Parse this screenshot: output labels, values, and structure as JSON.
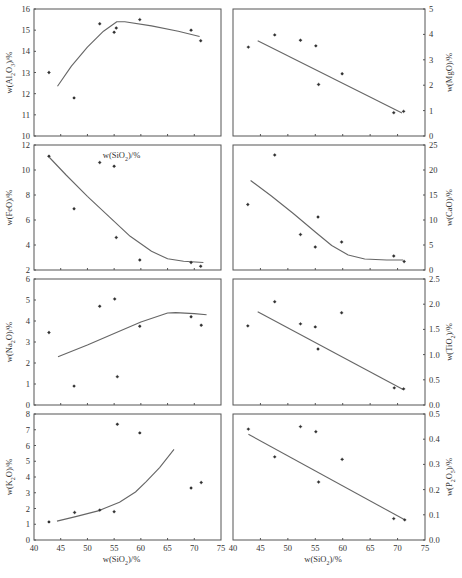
{
  "figure": {
    "x_axis_label": "w(SiO₂)/%",
    "x_ticks": [
      40,
      45,
      50,
      55,
      60,
      65,
      70,
      75
    ]
  },
  "chart_data": [
    {
      "id": "al2o3",
      "type": "scatter",
      "title": "",
      "xlabel": "w(SiO₂)/%",
      "ylabel": "w(Al₂O₃)/%",
      "xlim": [
        40,
        75
      ],
      "ylim": [
        10,
        16
      ],
      "y_ticks": [
        10,
        11,
        12,
        13,
        14,
        15,
        16
      ],
      "y_tick_format": 0,
      "axis_side": "left",
      "grid": false,
      "points": [
        [
          42.8,
          13.0
        ],
        [
          47.5,
          11.8
        ],
        [
          52.3,
          15.3
        ],
        [
          55.0,
          14.9
        ],
        [
          55.4,
          15.1
        ],
        [
          59.8,
          15.5
        ],
        [
          69.4,
          15.0
        ],
        [
          71.2,
          14.5
        ]
      ],
      "trend": [
        [
          44.4,
          12.35
        ],
        [
          47,
          13.3
        ],
        [
          50,
          14.2
        ],
        [
          53,
          14.95
        ],
        [
          55.5,
          15.4
        ],
        [
          57,
          15.4
        ],
        [
          62,
          15.2
        ],
        [
          67,
          14.95
        ],
        [
          71,
          14.7
        ]
      ]
    },
    {
      "id": "mgo",
      "type": "scatter",
      "title": "",
      "xlabel": "",
      "ylabel": "w(MgO)/%",
      "xlim": [
        40,
        75
      ],
      "ylim": [
        0,
        5
      ],
      "y_ticks": [
        0,
        1,
        2,
        3,
        4,
        5
      ],
      "y_tick_format": 0,
      "axis_side": "right",
      "grid": false,
      "points": [
        [
          42.8,
          3.5
        ],
        [
          47.6,
          3.98
        ],
        [
          52.3,
          3.77
        ],
        [
          55.1,
          3.55
        ],
        [
          55.6,
          2.03
        ],
        [
          59.9,
          2.45
        ],
        [
          69.3,
          0.92
        ],
        [
          71.1,
          0.97
        ]
      ],
      "trend": [
        [
          44.5,
          3.75
        ],
        [
          70.8,
          0.9
        ]
      ]
    },
    {
      "id": "feo",
      "type": "scatter",
      "title": "",
      "xlabel": "",
      "ylabel": "w(FeO)/%",
      "xlim": [
        40,
        75
      ],
      "ylim": [
        2,
        12
      ],
      "y_ticks": [
        2,
        4,
        6,
        8,
        10,
        12
      ],
      "y_tick_format": 0,
      "axis_side": "left",
      "grid": false,
      "points": [
        [
          42.8,
          11.1
        ],
        [
          47.5,
          6.9
        ],
        [
          52.3,
          10.6
        ],
        [
          55.0,
          10.3
        ],
        [
          55.4,
          4.6
        ],
        [
          59.8,
          2.8
        ],
        [
          69.4,
          2.6
        ],
        [
          71.2,
          2.3
        ]
      ],
      "trend": [
        [
          42.9,
          11.0
        ],
        [
          46,
          9.6
        ],
        [
          50,
          7.9
        ],
        [
          54,
          6.3
        ],
        [
          58,
          4.7
        ],
        [
          62,
          3.5
        ],
        [
          65,
          2.9
        ],
        [
          68,
          2.7
        ],
        [
          71.7,
          2.6
        ]
      ]
    },
    {
      "id": "cao",
      "type": "scatter",
      "title": "",
      "xlabel": "",
      "ylabel": "w(CaO)/%",
      "xlim": [
        40,
        75
      ],
      "ylim": [
        0,
        25
      ],
      "y_ticks": [
        0,
        5,
        10,
        15,
        20,
        25
      ],
      "y_tick_format": 0,
      "axis_side": "right",
      "grid": false,
      "points": [
        [
          42.7,
          13.1
        ],
        [
          47.6,
          23.0
        ],
        [
          52.3,
          7.1
        ],
        [
          55.0,
          4.6
        ],
        [
          55.5,
          10.6
        ],
        [
          59.8,
          5.6
        ],
        [
          69.3,
          2.8
        ],
        [
          71.2,
          1.7
        ]
      ],
      "trend": [
        [
          43.2,
          17.9
        ],
        [
          47,
          14.8
        ],
        [
          51,
          11.3
        ],
        [
          55,
          7.6
        ],
        [
          58,
          4.9
        ],
        [
          61,
          3.0
        ],
        [
          64,
          2.2
        ],
        [
          68,
          2.0
        ],
        [
          71,
          2.0
        ]
      ]
    },
    {
      "id": "na2o",
      "type": "scatter",
      "title": "",
      "xlabel": "",
      "ylabel": "w(Na₂O)/%",
      "xlim": [
        40,
        75
      ],
      "ylim": [
        0,
        6
      ],
      "y_ticks": [
        0,
        1,
        2,
        3,
        4,
        5,
        6
      ],
      "y_tick_format": 0,
      "axis_side": "left",
      "grid": false,
      "points": [
        [
          42.8,
          3.45
        ],
        [
          47.5,
          0.9
        ],
        [
          52.3,
          4.7
        ],
        [
          55.1,
          5.05
        ],
        [
          55.6,
          1.35
        ],
        [
          59.8,
          3.75
        ],
        [
          69.4,
          4.2
        ],
        [
          71.3,
          3.8
        ]
      ],
      "trend": [
        [
          44.5,
          2.3
        ],
        [
          50,
          2.85
        ],
        [
          55,
          3.4
        ],
        [
          60,
          3.95
        ],
        [
          65,
          4.38
        ],
        [
          66.5,
          4.4
        ],
        [
          70,
          4.35
        ],
        [
          72.3,
          4.3
        ]
      ]
    },
    {
      "id": "tio2",
      "type": "scatter",
      "title": "",
      "xlabel": "",
      "ylabel": "w(TiO₂)/%",
      "xlim": [
        40,
        75
      ],
      "ylim": [
        0,
        2.5
      ],
      "y_ticks": [
        0,
        0.5,
        1,
        1.5,
        2,
        2.5
      ],
      "y_tick_format": 1,
      "axis_side": "right",
      "grid": false,
      "points": [
        [
          42.7,
          1.57
        ],
        [
          47.6,
          2.05
        ],
        [
          52.3,
          1.61
        ],
        [
          55.0,
          1.55
        ],
        [
          55.5,
          1.11
        ],
        [
          59.8,
          1.83
        ],
        [
          69.4,
          0.34
        ],
        [
          71.1,
          0.32
        ]
      ],
      "trend": [
        [
          44.5,
          1.85
        ],
        [
          71.0,
          0.31
        ]
      ]
    },
    {
      "id": "k2o",
      "type": "scatter",
      "title": "",
      "xlabel": "w(SiO₂)/%",
      "ylabel": "w(K₂O)/%",
      "xlim": [
        40,
        75
      ],
      "ylim": [
        0,
        8
      ],
      "y_ticks": [
        0,
        1,
        2,
        3,
        4,
        5,
        6,
        7,
        8
      ],
      "y_tick_format": 0,
      "axis_side": "left",
      "grid": false,
      "points": [
        [
          42.8,
          1.15
        ],
        [
          47.6,
          1.75
        ],
        [
          52.3,
          1.9
        ],
        [
          55.0,
          1.8
        ],
        [
          55.6,
          7.35
        ],
        [
          59.8,
          6.8
        ],
        [
          69.4,
          3.3
        ],
        [
          71.3,
          3.65
        ]
      ],
      "trend": [
        [
          44.3,
          1.2
        ],
        [
          48,
          1.5
        ],
        [
          52,
          1.85
        ],
        [
          56,
          2.4
        ],
        [
          59,
          3.05
        ],
        [
          61,
          3.7
        ],
        [
          63.5,
          4.6
        ],
        [
          66.2,
          5.75
        ]
      ]
    },
    {
      "id": "p2o5",
      "type": "scatter",
      "title": "",
      "xlabel": "w(SiO₂)/%",
      "ylabel": "w(P₂O₅)/%",
      "xlim": [
        40,
        75
      ],
      "ylim": [
        0,
        0.5
      ],
      "y_ticks": [
        0,
        0.1,
        0.2,
        0.3,
        0.4,
        0.5
      ],
      "y_tick_format": 1,
      "axis_side": "right",
      "grid": false,
      "points": [
        [
          42.8,
          0.44
        ],
        [
          47.6,
          0.33
        ],
        [
          52.3,
          0.45
        ],
        [
          55.1,
          0.43
        ],
        [
          55.6,
          0.23
        ],
        [
          59.9,
          0.32
        ],
        [
          69.3,
          0.085
        ],
        [
          71.3,
          0.08
        ]
      ],
      "trend": [
        [
          42.8,
          0.42
        ],
        [
          71.3,
          0.08
        ]
      ]
    }
  ],
  "layout": {
    "columns_x": [
      [
        34,
        221
      ],
      [
        233,
        425
      ]
    ],
    "rows_y": [
      [
        9,
        136
      ],
      [
        145,
        270
      ],
      [
        279,
        405
      ],
      [
        414,
        540
      ]
    ]
  },
  "colors": {
    "axis": "#555555",
    "line": "#666666",
    "point": "#333333",
    "text": "#333333"
  }
}
